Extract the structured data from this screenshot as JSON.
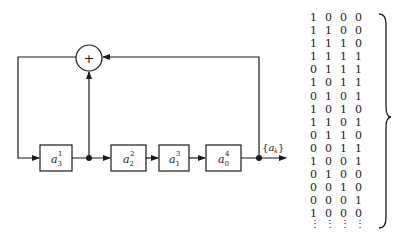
{
  "diagram": {
    "type": "linear-feedback-shift-register",
    "summer": {
      "symbol": "+"
    },
    "registers": [
      {
        "base": "a",
        "sub": "3",
        "sup": "1"
      },
      {
        "base": "a",
        "sub": "2",
        "sup": "2"
      },
      {
        "base": "a",
        "sub": "1",
        "sup": "3"
      },
      {
        "base": "a",
        "sub": "0",
        "sup": "4"
      }
    ],
    "output_label": {
      "open": "{",
      "base": "a",
      "sub": "k",
      "close": "}"
    },
    "colors": {
      "line": "#1a1a1a",
      "background": "#ffffff"
    }
  },
  "state_table": {
    "rows": [
      [
        "1",
        "0",
        "0",
        "0"
      ],
      [
        "1",
        "1",
        "0",
        "0"
      ],
      [
        "1",
        "1",
        "1",
        "0"
      ],
      [
        "1",
        "1",
        "1",
        "1"
      ],
      [
        "0",
        "1",
        "1",
        "1"
      ],
      [
        "1",
        "0",
        "1",
        "1"
      ],
      [
        "0",
        "1",
        "0",
        "1"
      ],
      [
        "1",
        "0",
        "1",
        "0"
      ],
      [
        "1",
        "1",
        "0",
        "1"
      ],
      [
        "0",
        "1",
        "1",
        "0"
      ],
      [
        "0",
        "0",
        "1",
        "1"
      ],
      [
        "1",
        "0",
        "0",
        "1"
      ],
      [
        "0",
        "1",
        "0",
        "0"
      ],
      [
        "0",
        "0",
        "1",
        "0"
      ],
      [
        "0",
        "0",
        "0",
        "1"
      ],
      [
        "1",
        "0",
        "0",
        "0"
      ]
    ],
    "continuation": [
      "⋮",
      "⋮",
      "⋮",
      "⋮"
    ],
    "brace": "}"
  }
}
